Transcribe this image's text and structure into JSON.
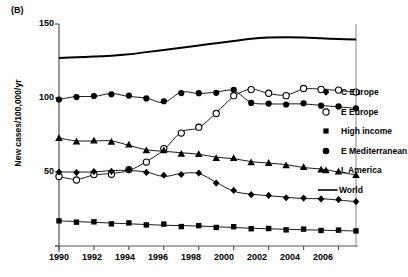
{
  "panel": {
    "label": "(B)"
  },
  "axes": {
    "ylabel": "New cases/100,000/yr",
    "yticks": [
      "150",
      "100",
      "50",
      "0"
    ],
    "xticks": [
      "1990",
      "1992",
      "1994",
      "1996",
      "1998",
      "2000",
      "2002",
      "2004",
      "2006"
    ]
  },
  "legend": {
    "items": [
      {
        "label": "C Europe",
        "marker": "filled-diamond",
        "color": "#000000"
      },
      {
        "label": "E Europe",
        "marker": "open-circle",
        "color": "#000000"
      },
      {
        "label": "High income",
        "marker": "filled-square",
        "color": "#000000"
      },
      {
        "label": "E Mediterranean",
        "marker": "filled-circle",
        "color": "#000000"
      },
      {
        "label": "L America",
        "marker": "filled-triangle",
        "color": "#000000"
      },
      {
        "label": "World",
        "marker": "line",
        "color": "#000000"
      }
    ]
  },
  "chart_data": {
    "type": "line",
    "title": "",
    "subtitle": "",
    "panel_label": "(B)",
    "xlabel": "",
    "ylabel": "New cases/100,000/yr",
    "xlim": [
      1990,
      2007
    ],
    "ylim": [
      0,
      150
    ],
    "xticks": [
      1990,
      1992,
      1994,
      1996,
      1998,
      2000,
      2002,
      2004,
      2006
    ],
    "yticks": [
      0,
      50,
      100,
      150
    ],
    "grid": false,
    "legend_position": "right",
    "x": [
      1990,
      1991,
      1992,
      1993,
      1994,
      1995,
      1996,
      1997,
      1998,
      1999,
      2000,
      2001,
      2002,
      2003,
      2004,
      2005,
      2006,
      2007
    ],
    "series": [
      {
        "name": "World",
        "marker": "none",
        "linewidth": 2,
        "values": [
          127,
          127.5,
          128,
          128.5,
          129.5,
          131,
          132.5,
          134,
          135.5,
          137,
          138.5,
          140,
          140.8,
          141,
          140.8,
          140.3,
          139.8,
          139.5
        ]
      },
      {
        "name": "E Mediterranean",
        "marker": "filled-circle",
        "values": [
          99,
          101,
          101,
          103,
          101,
          100,
          97,
          104,
          103,
          104,
          105,
          97,
          96,
          96,
          96,
          95,
          94,
          93
        ]
      },
      {
        "name": "E Europe",
        "marker": "open-circle",
        "values": [
          47,
          45,
          48,
          49,
          51,
          57,
          65,
          77,
          80,
          90,
          101,
          106,
          103,
          102,
          106,
          106,
          105,
          104
        ]
      },
      {
        "name": "L America",
        "marker": "filled-triangle",
        "values": [
          73,
          71,
          71,
          71,
          68,
          65,
          64,
          63,
          62,
          60,
          59,
          57,
          56,
          55,
          53,
          52,
          50,
          48
        ]
      },
      {
        "name": "C Europe",
        "marker": "filled-diamond",
        "values": [
          50,
          50,
          50,
          51,
          51,
          50,
          47,
          49,
          49,
          43,
          37,
          35,
          34,
          33,
          32,
          32,
          31,
          30
        ]
      },
      {
        "name": "High income",
        "marker": "filled-square",
        "values": [
          17,
          16.5,
          16,
          15.5,
          15,
          14.5,
          14,
          13.8,
          13.5,
          13,
          12.5,
          12,
          11.6,
          11.3,
          11,
          10.7,
          10.4,
          10.2
        ]
      }
    ]
  }
}
